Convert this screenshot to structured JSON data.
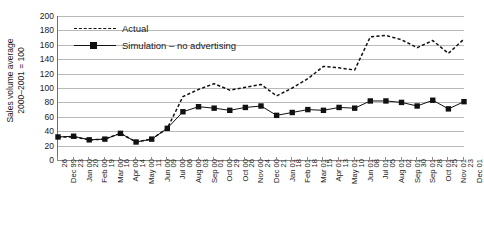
{
  "chart_data": {
    "type": "line",
    "title": "",
    "xlabel": "",
    "ylabel": "Sales volume average 2000-2001 = 100",
    "ylabel_line1": "Sales volume average",
    "ylabel_line2": "2000–2001 = 100",
    "ylim": [
      0,
      200
    ],
    "ytick_step": 20,
    "yticks": [
      200,
      180,
      160,
      140,
      120,
      100,
      80,
      60,
      40,
      20,
      0
    ],
    "grid": true,
    "legend_position": "top-left",
    "categories": [
      "26 Dec 99",
      "23 Jan 00",
      "20 Feb 00",
      "19 Mar 00",
      "16 Apr 00",
      "14 May 00",
      "11 Jun 00",
      "09 Jul 00",
      "06 Aug 00",
      "03 Sep 00",
      "01 Oct 00",
      "29 Oct 00",
      "26 Nov 00",
      "24 Dec 00",
      "21 Jan 01",
      "18 Feb 01",
      "18 Mar 01",
      "15 Apr 01",
      "13 May 01",
      "10 Jun 01",
      "08 Jul 01",
      "05 Aug 01",
      "02 Sep 01",
      "30 Sep 01",
      "28 Oct 01",
      "25 Nov 01",
      "23 Dec 01"
    ],
    "categories_split": [
      [
        "26",
        "Dec 99"
      ],
      [
        "23",
        "Jan 00"
      ],
      [
        "20",
        "Feb 00"
      ],
      [
        "19",
        "Mar 00"
      ],
      [
        "16",
        "Apr 00"
      ],
      [
        "14",
        "May 00"
      ],
      [
        "11",
        "Jun 00"
      ],
      [
        "09",
        "Jul 00"
      ],
      [
        "06",
        "Aug 00"
      ],
      [
        "03",
        "Sep 00"
      ],
      [
        "01",
        "Oct 00"
      ],
      [
        "29",
        "Oct 00"
      ],
      [
        "26",
        "Nov 00"
      ],
      [
        "24",
        "Dec 00"
      ],
      [
        "21",
        "Jan 01"
      ],
      [
        "18",
        "Feb 01"
      ],
      [
        "18",
        "Mar 01"
      ],
      [
        "15",
        "Apr 01"
      ],
      [
        "13",
        "May 01"
      ],
      [
        "10",
        "Jun 01"
      ],
      [
        "08",
        "Jul 01"
      ],
      [
        "05",
        "Aug 01"
      ],
      [
        "02",
        "Sep 01"
      ],
      [
        "30",
        "Sep 01"
      ],
      [
        "28",
        "Oct 01"
      ],
      [
        "25",
        "Nov 01"
      ],
      [
        "23",
        "Dec 01"
      ]
    ],
    "series": [
      {
        "name": "Actual",
        "style": "dashed",
        "marker": "none",
        "color": "#111111",
        "values": [
          32,
          32,
          28,
          29,
          37,
          25,
          29,
          44,
          88,
          98,
          106,
          97,
          101,
          105,
          89,
          100,
          113,
          130,
          128,
          125,
          171,
          173,
          167,
          156,
          166,
          148,
          168
        ]
      },
      {
        "name": "Simulation – no advertising",
        "style": "solid",
        "marker": "square",
        "color": "#111111",
        "values": [
          32,
          33,
          28,
          29,
          37,
          25,
          29,
          44,
          67,
          74,
          72,
          69,
          73,
          75,
          62,
          66,
          70,
          69,
          73,
          72,
          82,
          82,
          80,
          75,
          83,
          71,
          81
        ]
      }
    ]
  },
  "legend": {
    "entries": [
      {
        "label": "Actual",
        "key": "dashed-line-key"
      },
      {
        "label": "Simulation – no advertising",
        "key": "square-marker-line-key"
      }
    ]
  },
  "colors": {
    "series": "#111111",
    "gridline": "#b9b9b9",
    "axis": "#6e6e6e",
    "text": "#1a1a1a",
    "background": "#ffffff"
  }
}
